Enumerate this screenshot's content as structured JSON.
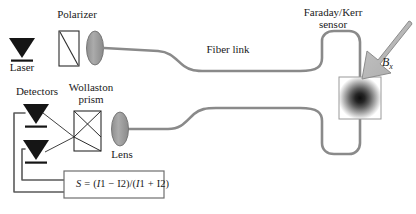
{
  "figure": {
    "background": "#ffffff"
  },
  "labels": {
    "polarizer": "Polarizer",
    "laser": "Laser",
    "detectors": "Detectors",
    "wollaston_prism_line1": "Wollaston",
    "wollaston_prism_line2": "prism",
    "lens": "Lens",
    "fiber_link": "Fiber link",
    "sensor_line1": "Faraday/Kerr",
    "sensor_line2": "sensor",
    "b_field_symbol": "B",
    "b_field_subscript": "x"
  },
  "formula": {
    "lhs": "S",
    "equals": "=",
    "numerator_open": "(",
    "i1_a": "I",
    "i1_a_num": "1",
    "minus": "−",
    "i2_a": "I",
    "i2_a_num": "2",
    "numerator_close": ")",
    "divider": "/",
    "denominator_open": "(",
    "i1_b": "I",
    "i1_b_num": "1",
    "plus": "+",
    "i2_b": "I",
    "i2_b_num": "2",
    "denominator_close": ")"
  },
  "colors": {
    "stroke_dark": "#2b2b2b",
    "fiber_gray": "#8a8a8a",
    "lens_fill": "#9c9c9c",
    "arrow_fill": "#b4b4b4",
    "arrow_stroke": "#8c8c8c",
    "detector_fill": "#1a1a1a",
    "sensor_core": "#151515",
    "text": "#1a1a1a",
    "box_stroke": "#6e6e6e"
  },
  "components": {
    "laser": "laser-source",
    "polarizer": "polarizer-plate",
    "collimating_lens": "collimating-lens",
    "fiber_upper": "fiber-link-upper",
    "fiber_lower": "fiber-link-lower",
    "sensor": "faraday-kerr-sensor",
    "magnetic_field_arrow": "magnetic-field-arrow",
    "focusing_lens": "focusing-lens",
    "wollaston_prism": "wollaston-prism",
    "detector_top": "detector-top",
    "detector_bottom": "detector-bottom",
    "signal_box": "signal-formula-box"
  }
}
